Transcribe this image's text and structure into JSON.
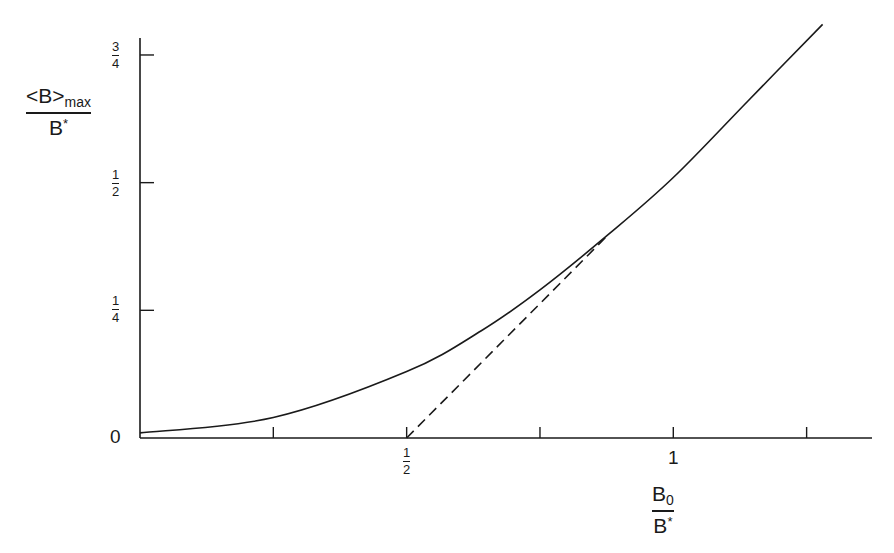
{
  "chart_data": {
    "type": "line",
    "title": "",
    "xlabel": "B_0 / B*",
    "ylabel": "<B>_max / B*",
    "xlim": [
      0,
      1.37
    ],
    "ylim": [
      0,
      0.78
    ],
    "grid": false,
    "legend": null,
    "x_ticks": [
      0,
      0.25,
      0.5,
      0.75,
      1,
      1.25
    ],
    "x_tick_labels": [
      "",
      "",
      "1/2",
      "",
      "1",
      ""
    ],
    "y_ticks": [
      0,
      0.25,
      0.5,
      0.75
    ],
    "y_tick_labels": [
      "0",
      "1/4",
      "1/2",
      "3/4"
    ],
    "series": [
      {
        "name": "<B>_max/B* curve",
        "style": "solid",
        "x": [
          0,
          0.25,
          0.5,
          0.64,
          0.75,
          0.88,
          1.0,
          1.14,
          1.28
        ],
        "y": [
          0.01,
          0.04,
          0.13,
          0.21,
          0.29,
          0.4,
          0.51,
          0.66,
          0.81
        ]
      },
      {
        "name": "tangent",
        "style": "dashed",
        "x": [
          0.5,
          0.88
        ],
        "y": [
          0,
          0.4
        ]
      }
    ]
  },
  "labels": {
    "y_title_num_main": "<B>",
    "y_title_num_sub": "max",
    "y_title_den_main": "B",
    "y_title_den_sup": "*",
    "x_title_num_main": "B",
    "x_title_num_sub": "0",
    "x_title_den_main": "B",
    "x_title_den_sup": "*",
    "y_zero": "0",
    "x_one": "1",
    "frac_y34_num": "3",
    "frac_y34_den": "4",
    "frac_y12_num": "1",
    "frac_y12_den": "2",
    "frac_y14_num": "1",
    "frac_y14_den": "4",
    "frac_x12_num": "1",
    "frac_x12_den": "2"
  }
}
